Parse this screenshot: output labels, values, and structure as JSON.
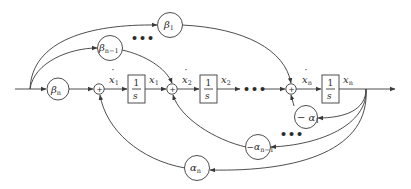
{
  "diagram": {
    "type": "signal-flow block diagram (observable canonical form)",
    "colors": {
      "line": "#3a3a3a",
      "text": "#2a2a2a",
      "background": "#ffffff"
    },
    "gains_forward": [
      {
        "id": "beta_n",
        "symbol": "β",
        "subscript": "n"
      },
      {
        "id": "beta_n_minus_1",
        "symbol": "β",
        "subscript": "n−1"
      },
      {
        "id": "beta_1",
        "symbol": "β",
        "subscript": "1"
      }
    ],
    "gains_feedback": [
      {
        "id": "neg_alpha_1",
        "prefix": "− ",
        "symbol": "α",
        "subscript": "1"
      },
      {
        "id": "neg_alpha_n_minus_1",
        "prefix": "−",
        "symbol": "α",
        "subscript": "n−1"
      },
      {
        "id": "alpha_n",
        "prefix": "",
        "symbol": "α",
        "subscript": "n"
      }
    ],
    "integrators": [
      {
        "id": "int1",
        "numerator": "1",
        "denominator": "s"
      },
      {
        "id": "int2",
        "numerator": "1",
        "denominator": "s"
      },
      {
        "id": "intn",
        "numerator": "1",
        "denominator": "s"
      }
    ],
    "summing_junctions": [
      {
        "id": "sum1",
        "sign": "+"
      },
      {
        "id": "sum2",
        "sign": "+"
      },
      {
        "id": "sumn",
        "sign": "+"
      }
    ],
    "signals": {
      "xdot1": {
        "symbol": "x",
        "subscript": "1",
        "dot": "·"
      },
      "x1": {
        "symbol": "x",
        "subscript": "1"
      },
      "xdot2": {
        "symbol": "x",
        "subscript": "2",
        "dot": "·"
      },
      "x2": {
        "symbol": "x",
        "subscript": "2"
      },
      "xdotn": {
        "symbol": "x",
        "subscript": "n",
        "dot": "·"
      },
      "xn": {
        "symbol": "x",
        "subscript": "n"
      }
    },
    "ellipses": {
      "main_path": "•••",
      "forward_gains": "•••",
      "feedback_gains": "•••"
    }
  }
}
